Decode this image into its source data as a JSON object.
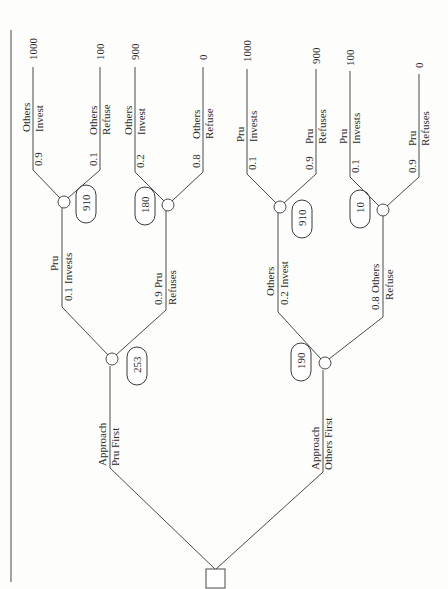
{
  "diagram": {
    "type": "decision-tree",
    "orientation": "rotated-90-ccw",
    "root": {
      "type": "decision",
      "branches": [
        {
          "label_line1": "Approach",
          "label_line2": "Pru First",
          "expected_value": "253",
          "chance": {
            "branches": [
              {
                "label_line1": "Pru",
                "label_line2": "Invests",
                "probability": "0.1",
                "expected_value": "910",
                "outcomes": [
                  {
                    "label_line1": "Others",
                    "label_line2": "Invest",
                    "probability": "0.9",
                    "payoff": "1000"
                  },
                  {
                    "label_line1": "Others",
                    "label_line2": "Refuse",
                    "probability": "0.1",
                    "payoff": "100"
                  }
                ]
              },
              {
                "label_line1": "Pru",
                "label_line2": "Refuses",
                "probability": "0.9",
                "expected_value": "180",
                "outcomes": [
                  {
                    "label_line1": "Others",
                    "label_line2": "Invest",
                    "probability": "0.2",
                    "payoff": "900"
                  },
                  {
                    "label_line1": "Others",
                    "label_line2": "Refuse",
                    "probability": "0.8",
                    "payoff": "0"
                  }
                ]
              }
            ]
          }
        },
        {
          "label_line1": "Approach",
          "label_line2": "Others First",
          "expected_value": "190",
          "chance": {
            "branches": [
              {
                "label_line1": "Others",
                "label_line2": "Invest",
                "probability": "0.2",
                "expected_value": "910",
                "outcomes": [
                  {
                    "label_line1": "Pru",
                    "label_line2": "Invests",
                    "probability": "0.1",
                    "payoff": "1000"
                  },
                  {
                    "label_line1": "Pru",
                    "label_line2": "Refuses",
                    "probability": "0.9",
                    "payoff": "900"
                  }
                ]
              },
              {
                "label_line1": "Others",
                "label_line2": "Refuse",
                "probability": "0.8",
                "expected_value": "10",
                "outcomes": [
                  {
                    "label_line1": "Pru",
                    "label_line2": "Invests",
                    "probability": "0.1",
                    "payoff": "100"
                  },
                  {
                    "label_line1": "Pru",
                    "label_line2": "Refuses",
                    "probability": "0.9",
                    "payoff": "0"
                  }
                ]
              }
            ]
          }
        }
      ]
    },
    "colors": {
      "line": "#4a4a4a",
      "text": "#2a2a2a",
      "background": "#fdfdfb"
    }
  }
}
